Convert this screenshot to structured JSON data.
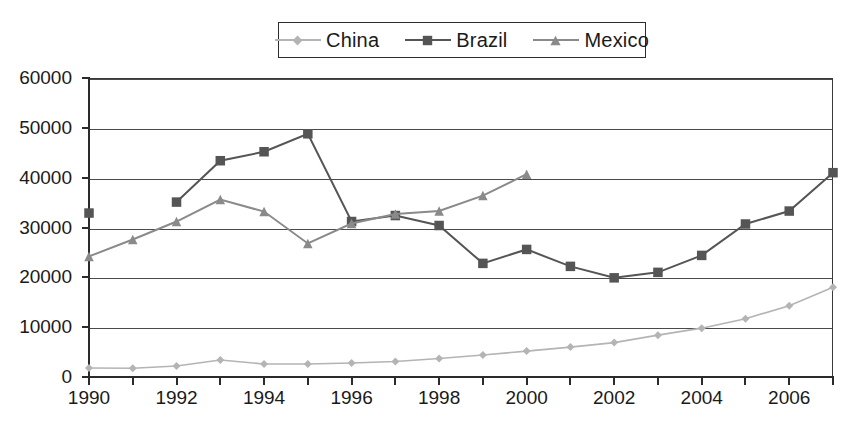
{
  "chart_data": {
    "type": "line",
    "title": "",
    "xlabel": "",
    "ylabel": "",
    "x": [
      1990,
      1991,
      1992,
      1993,
      1994,
      1995,
      1996,
      1997,
      1998,
      1999,
      2000,
      2001,
      2002,
      2003,
      2004,
      2005,
      2006,
      2007
    ],
    "xlim": [
      1990,
      2007
    ],
    "ylim": [
      0,
      60000
    ],
    "ytick_labels": [
      "0",
      "10000",
      "20000",
      "30000",
      "40000",
      "50000",
      "60000"
    ],
    "ytick_values": [
      0,
      10000,
      20000,
      30000,
      40000,
      50000,
      60000
    ],
    "xtick_labels": [
      "1990",
      "1992",
      "1994",
      "1996",
      "1998",
      "2000",
      "2002",
      "2004",
      "2006"
    ],
    "xtick_values": [
      1990,
      1992,
      1994,
      1996,
      1998,
      2000,
      2002,
      2004,
      2006
    ],
    "grid": "horizontal",
    "legend_position": "top-center",
    "series": [
      {
        "name": "China",
        "color": "#b4b4b4",
        "marker": "diamond",
        "x": [
          1990,
          1991,
          1992,
          1993,
          1994,
          1995,
          1996,
          1997,
          1998,
          1999,
          2000,
          2001,
          2002,
          2003,
          2004,
          2005,
          2006,
          2007
        ],
        "values": [
          1800,
          1750,
          2200,
          3400,
          2600,
          2600,
          2800,
          3100,
          3700,
          4400,
          5200,
          6000,
          6900,
          8400,
          9800,
          11700,
          14300,
          18000
        ]
      },
      {
        "name": "Brazil",
        "color": "#555555",
        "marker": "square",
        "x": [
          1990,
          1992,
          1993,
          1994,
          1995,
          1996,
          1997,
          1998,
          1999,
          2000,
          2001,
          2002,
          2003,
          2004,
          2005,
          2006,
          2007
        ],
        "values": [
          32900,
          35100,
          43400,
          45200,
          48800,
          31200,
          32400,
          30400,
          22800,
          25600,
          22200,
          19900,
          21000,
          24400,
          30700,
          33300,
          41000
        ],
        "gap_after": [
          1990
        ]
      },
      {
        "name": "Mexico",
        "color": "#8a8a8a",
        "marker": "triangle",
        "x": [
          1990,
          1991,
          1992,
          1993,
          1994,
          1995,
          1996,
          1997,
          1998,
          1999,
          2000
        ],
        "values": [
          24200,
          27600,
          31200,
          35600,
          33200,
          26800,
          30800,
          32700,
          33300,
          36400,
          40700
        ]
      }
    ]
  },
  "legend": {
    "items": [
      {
        "label": "China"
      },
      {
        "label": "Brazil"
      },
      {
        "label": "Mexico"
      }
    ]
  }
}
